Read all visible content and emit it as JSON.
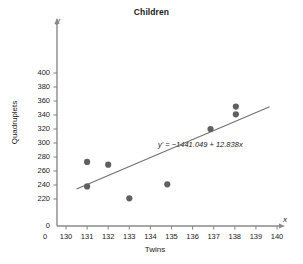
{
  "chart_data": {
    "type": "scatter",
    "title": "Children",
    "xlabel": "Twins",
    "ylabel": "Quadruplets",
    "x_axis_name": "x",
    "y_axis_name": "y",
    "xticks": [
      0,
      130,
      131,
      132,
      133,
      134,
      135,
      136,
      137,
      138,
      139,
      140
    ],
    "xtick_labels": [
      "0",
      "130",
      "131",
      "132",
      "133",
      "134",
      "135",
      "136",
      "137",
      "138",
      "139",
      "140"
    ],
    "yticks": [
      0,
      220,
      240,
      260,
      280,
      300,
      320,
      340,
      360,
      380,
      400
    ],
    "ytick_labels": [
      "0",
      "220",
      "240",
      "260",
      "280",
      "300",
      "320",
      "340",
      "360",
      "380",
      "400"
    ],
    "xlim": [
      130,
      140
    ],
    "ylim": [
      210,
      405
    ],
    "grid": false,
    "legend": false,
    "axis_break": true,
    "points": [
      {
        "x": 131.0,
        "y": 273
      },
      {
        "x": 131.0,
        "y": 238
      },
      {
        "x": 132.0,
        "y": 269
      },
      {
        "x": 133.0,
        "y": 221
      },
      {
        "x": 134.8,
        "y": 241
      },
      {
        "x": 136.85,
        "y": 320
      },
      {
        "x": 138.05,
        "y": 341
      },
      {
        "x": 138.05,
        "y": 352
      }
    ],
    "trendline": {
      "equation_text": "y' = −1441.049 + 12.838x",
      "intercept": -1441.049,
      "slope": 12.838,
      "x_start": 130.5,
      "x_end": 139.65
    },
    "colors": {
      "point": "#606060",
      "line": "#707070",
      "axis": "#8a8a8a",
      "text": "#1a1a1a",
      "background": "#ffffff"
    }
  }
}
